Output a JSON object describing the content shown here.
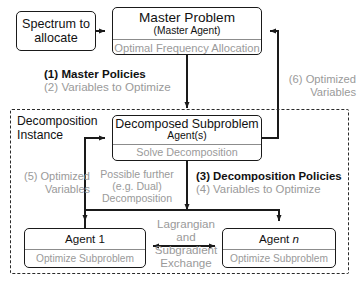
{
  "diagram": {
    "colors": {
      "stroke": "#1a1a1a",
      "muted_text": "#9a9a9a",
      "background": "#ffffff"
    }
  },
  "boxes": {
    "spectrum": {
      "title": "Spectrum to allocate"
    },
    "master": {
      "title": "Master Problem",
      "subtitle": "(Master Agent)",
      "footer": "Optimal Frequency Allocation"
    },
    "subproblem": {
      "title": "Decomposed Subproblem",
      "subtitle": "Agent(s)",
      "footer": "Solve Decomposition"
    },
    "agent1": {
      "title": "Agent 1",
      "footer": "Optimize Subproblem"
    },
    "agentn": {
      "title_prefix": "Agent ",
      "title_suffix": "n",
      "footer": "Optimize Subproblem"
    }
  },
  "container": {
    "label_line1": "Decomposition",
    "label_line2": "Instance"
  },
  "labels": {
    "master_policies": "(1) Master Policies",
    "variables_to_optimize_2": "(2) Variables to Optimize",
    "optimized_6_line1": "(6) Optimized",
    "optimized_6_line2": "Variables",
    "optimized_5_line1": "(5) Optimized",
    "optimized_5_line2": "Variables",
    "possible_line1": "Possible further",
    "possible_line2": "(e.g. Dual)",
    "possible_line3": "Decomposition",
    "decomposition_policies_3": "(3) Decomposition Policies",
    "variables_to_optimize_4": "(4) Variables to Optimize",
    "exchange_line1": "Lagrangian",
    "exchange_line2": "and",
    "exchange_line3": "Subgradient",
    "exchange_line4": "Exchange"
  }
}
